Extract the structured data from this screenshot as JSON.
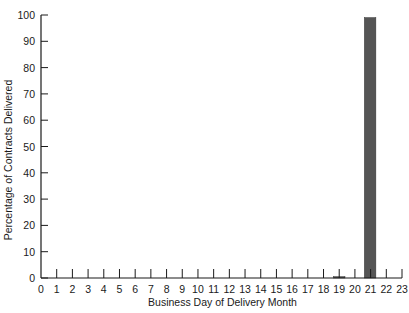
{
  "chart_data": {
    "type": "bar",
    "title": "",
    "xlabel": "Business Day of Delivery Month",
    "ylabel": "Percentage of Contracts Delivered",
    "xlim": [
      0,
      23
    ],
    "ylim": [
      0,
      100
    ],
    "x_ticks": [
      0,
      1,
      2,
      3,
      4,
      5,
      6,
      7,
      8,
      9,
      10,
      11,
      12,
      13,
      14,
      15,
      16,
      17,
      18,
      19,
      20,
      21,
      22,
      23
    ],
    "y_ticks": [
      0,
      10,
      20,
      30,
      40,
      50,
      60,
      70,
      80,
      90,
      100
    ],
    "grid": false,
    "legend": null,
    "categories": [
      19,
      21
    ],
    "values": [
      0.5,
      99
    ],
    "bar_color": "#555555",
    "axis_color": "#1a1a1a"
  },
  "labels": {
    "xlabel": "Business Day of Delivery Month",
    "ylabel": "Percentage of Contracts Delivered"
  }
}
